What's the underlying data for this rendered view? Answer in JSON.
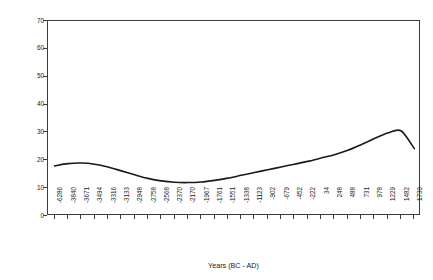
{
  "chart_data": {
    "type": "line",
    "title": "",
    "xlabel": "Years (BC - AD)",
    "ylabel": "Arboreal/Non-Arboreal Pollen %",
    "ylim": [
      0,
      70
    ],
    "yticks": [
      70,
      60,
      50,
      40,
      30,
      20,
      10,
      0
    ],
    "grid": false,
    "legend": null,
    "line_color": "#1a1a1a",
    "frame_color": "#3c3c3c",
    "background": "#ffffff",
    "categories": [
      "-6286",
      "-3840",
      "-3671",
      "-3494",
      "-3316",
      "-3133",
      "-2948",
      "-2758",
      "-2568",
      "-2370",
      "-2170",
      "-1967",
      "-1761",
      "-1551",
      "-1338",
      "-1123",
      "-902",
      "-679",
      "-452",
      "-222",
      "34",
      "248",
      "488",
      "731",
      "978",
      "1229",
      "1482",
      "1739"
    ],
    "values": [
      18.0,
      18.8,
      19.0,
      18.6,
      17.6,
      16.2,
      14.8,
      13.5,
      12.6,
      12.1,
      12.0,
      12.2,
      12.8,
      13.6,
      14.6,
      15.6,
      16.6,
      17.6,
      18.6,
      19.6,
      20.8,
      22.0,
      23.6,
      25.6,
      27.8,
      29.8,
      30.6,
      24.2
    ],
    "series_name": "Arboreal/Non-Arboreal Pollen %"
  }
}
